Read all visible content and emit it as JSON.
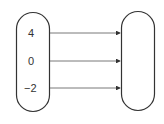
{
  "diagram": {
    "type": "mapping",
    "domain_set": {
      "elements": [
        "4",
        "0",
        "−2"
      ]
    },
    "codomain_set": {
      "elements": []
    },
    "arrows": [
      {
        "from": "4",
        "to": "codomain"
      },
      {
        "from": "0",
        "to": "codomain"
      },
      {
        "from": "−2",
        "to": "codomain"
      }
    ]
  },
  "colors": {
    "stroke": "#333333",
    "background": "#ffffff"
  }
}
